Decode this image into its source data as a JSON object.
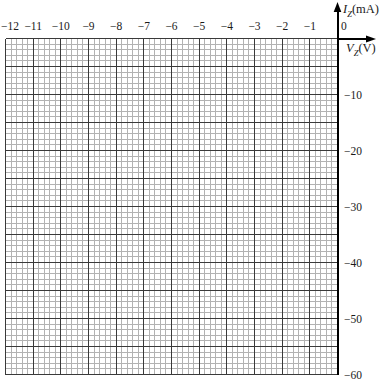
{
  "chart_data": {
    "type": "line",
    "title": "",
    "series": [],
    "xlabel": "VZ (V)",
    "ylabel": "IZ (mA)",
    "xlabel_parts": {
      "symbol": "V",
      "subscript": "Z",
      "unit": "(V)"
    },
    "ylabel_parts": {
      "symbol": "I",
      "subscript": "Z",
      "unit": "(mA)"
    },
    "xlim": [
      -12,
      0
    ],
    "ylim": [
      -60,
      0
    ],
    "x_major_step": 1,
    "x_minor_step": 0.2,
    "y_major_step": 5,
    "y_minor_step": 1,
    "grid": true,
    "legend": false,
    "x_tick_labels": [
      "−12",
      "−11",
      "−10",
      "−9",
      "−8",
      "−7",
      "−6",
      "−5",
      "−4",
      "−3",
      "−2",
      "−1"
    ],
    "origin_label": "0",
    "y_tick_labels": [
      "−10",
      "−20",
      "−30",
      "−40",
      "−50",
      "−60"
    ],
    "colors": {
      "background": "#ffffff",
      "axis": "#000000",
      "major_grid": "#3a3a3a",
      "minor_grid": "#b2b2b2",
      "text": "#1a1a1a"
    }
  }
}
